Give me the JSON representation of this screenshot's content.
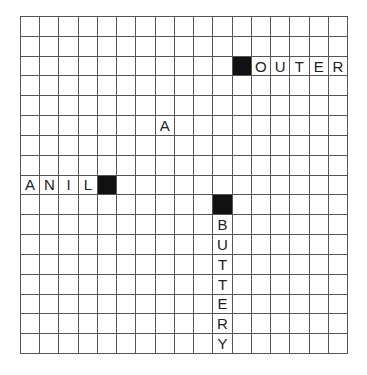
{
  "puzzle": {
    "rows": 17,
    "cols": 17,
    "block_color": "#111111",
    "line_color": "#555555",
    "blocks": [
      {
        "row": 2,
        "col": 11
      },
      {
        "row": 8,
        "col": 4
      },
      {
        "row": 9,
        "col": 10
      }
    ],
    "words": [
      {
        "text": "OUTER",
        "row": 2,
        "col": 12,
        "direction": "across"
      },
      {
        "text": "A",
        "row": 5,
        "col": 7,
        "direction": "across"
      },
      {
        "text": "ANIL",
        "row": 8,
        "col": 0,
        "direction": "across"
      },
      {
        "text": "BUTTERY",
        "row": 10,
        "col": 10,
        "direction": "down"
      }
    ]
  }
}
